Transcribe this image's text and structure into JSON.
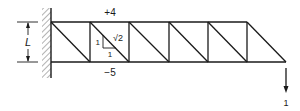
{
  "diagram": {
    "colors": {
      "line": "#1a1a1a",
      "hatch": "#555555",
      "background": "#ffffff"
    },
    "dimension": {
      "label": "L"
    },
    "member_forces": {
      "top_chord_label": "+4",
      "bottom_chord_label": "−5"
    },
    "slope_triangle": {
      "vertical": "1",
      "horizontal": "1",
      "hypotenuse": "√2"
    },
    "load": {
      "label": "1",
      "direction": "down"
    },
    "truss": {
      "panels": 6,
      "top_nodes_x": [
        51,
        90,
        129,
        169,
        208,
        247
      ],
      "bottom_nodes_x": [
        51,
        90,
        129,
        169,
        208,
        247,
        286
      ],
      "top_y": 22,
      "bottom_y": 62
    }
  }
}
